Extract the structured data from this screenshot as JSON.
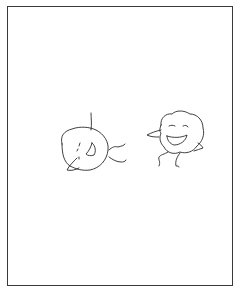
{
  "drawing": {
    "description": "Hand-drawn sketch of two round cartoon characters",
    "style": "black ink line drawing on white",
    "ink_color": "#2a2a2a",
    "background_color": "#ffffff",
    "characters": [
      {
        "name": "tilted-character",
        "pose": "lying tilted with antenna and pointed nose, smiling",
        "position": "left"
      },
      {
        "name": "laughing-character",
        "pose": "round blob body, closed happy eyes, big open smile, arms out, legs dangling",
        "position": "right"
      }
    ]
  }
}
